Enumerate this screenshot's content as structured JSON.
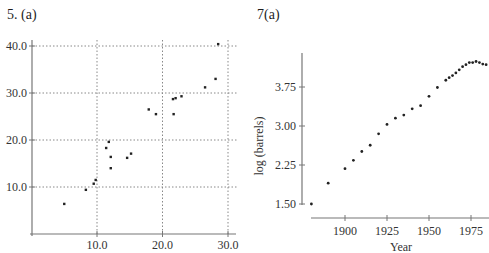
{
  "panels": {
    "left_title": "5.  (a)",
    "right_title": "7(a)"
  },
  "chart_data": [
    {
      "type": "scatter",
      "title": "5. (a)",
      "xlabel": "",
      "ylabel": "",
      "xlim": [
        0,
        31
      ],
      "ylim": [
        0,
        41
      ],
      "xticks": [
        10,
        20,
        30
      ],
      "xtick_labels": [
        "10.0",
        "20.0",
        "30.0"
      ],
      "yticks": [
        10,
        20,
        30,
        40
      ],
      "ytick_labels": [
        "10.0",
        "20.0",
        "30.0",
        "40.0"
      ],
      "grid": true,
      "grid_style": "dotted",
      "points": [
        {
          "x": 5.0,
          "y": 6.4
        },
        {
          "x": 8.3,
          "y": 9.4
        },
        {
          "x": 9.5,
          "y": 10.7
        },
        {
          "x": 9.8,
          "y": 11.5
        },
        {
          "x": 11.4,
          "y": 18.3
        },
        {
          "x": 11.8,
          "y": 19.6
        },
        {
          "x": 12.1,
          "y": 16.4
        },
        {
          "x": 12.1,
          "y": 14.0
        },
        {
          "x": 14.6,
          "y": 16.2
        },
        {
          "x": 15.2,
          "y": 17.1
        },
        {
          "x": 17.9,
          "y": 26.5
        },
        {
          "x": 19.0,
          "y": 25.5
        },
        {
          "x": 21.6,
          "y": 28.7
        },
        {
          "x": 22.0,
          "y": 28.9
        },
        {
          "x": 21.7,
          "y": 25.5
        },
        {
          "x": 22.9,
          "y": 29.3
        },
        {
          "x": 26.5,
          "y": 31.2
        },
        {
          "x": 28.1,
          "y": 33.0
        },
        {
          "x": 28.5,
          "y": 40.4
        }
      ]
    },
    {
      "type": "scatter",
      "title": "7(a)",
      "xlabel": "Year",
      "ylabel": "log (barrels)",
      "xlim": [
        1880,
        1986
      ],
      "ylim": [
        1.4,
        4.4
      ],
      "xticks": [
        1900,
        1925,
        1950,
        1975
      ],
      "xtick_labels": [
        "1900",
        "1925",
        "1950",
        "1975"
      ],
      "yticks": [
        1.5,
        2.25,
        3.0,
        3.75
      ],
      "ytick_labels": [
        "1.50",
        "2.25",
        "3.00",
        "3.75"
      ],
      "grid": false,
      "points": [
        {
          "x": 1880,
          "y": 1.5
        },
        {
          "x": 1890,
          "y": 1.9
        },
        {
          "x": 1900,
          "y": 2.18
        },
        {
          "x": 1905,
          "y": 2.34
        },
        {
          "x": 1910,
          "y": 2.51
        },
        {
          "x": 1915,
          "y": 2.63
        },
        {
          "x": 1920,
          "y": 2.85
        },
        {
          "x": 1925,
          "y": 3.03
        },
        {
          "x": 1930,
          "y": 3.15
        },
        {
          "x": 1935,
          "y": 3.21
        },
        {
          "x": 1940,
          "y": 3.33
        },
        {
          "x": 1945,
          "y": 3.39
        },
        {
          "x": 1950,
          "y": 3.57
        },
        {
          "x": 1955,
          "y": 3.74
        },
        {
          "x": 1960,
          "y": 3.88
        },
        {
          "x": 1962,
          "y": 3.93
        },
        {
          "x": 1964,
          "y": 3.97
        },
        {
          "x": 1966,
          "y": 4.02
        },
        {
          "x": 1968,
          "y": 4.08
        },
        {
          "x": 1970,
          "y": 4.14
        },
        {
          "x": 1972,
          "y": 4.18
        },
        {
          "x": 1974,
          "y": 4.22
        },
        {
          "x": 1976,
          "y": 4.22
        },
        {
          "x": 1978,
          "y": 4.24
        },
        {
          "x": 1980,
          "y": 4.22
        },
        {
          "x": 1982,
          "y": 4.19
        },
        {
          "x": 1984,
          "y": 4.18
        }
      ]
    }
  ]
}
